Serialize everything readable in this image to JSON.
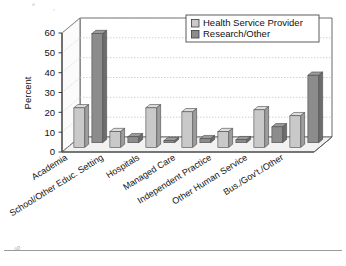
{
  "chart_data": {
    "type": "bar",
    "title": "",
    "subtitle": "",
    "xlabel": "",
    "ylabel": "Percent",
    "ylim": [
      0,
      60
    ],
    "yticks": [
      0,
      10,
      20,
      30,
      40,
      50,
      60
    ],
    "grid": true,
    "three_d": true,
    "legend_position": "top-right",
    "categories": [
      "Academia",
      "School/Other Educ. Setting",
      "Hospitals",
      "Managed Care",
      "Independent Practice",
      "Other Human Service",
      "Bus./Gov't./Other"
    ],
    "series": [
      {
        "name": "Health Service Provider",
        "color": "#c9c9c9",
        "values": [
          20,
          8,
          20,
          18,
          8,
          19,
          16
        ]
      },
      {
        "name": "Research/Other",
        "color": "#8c8c8c",
        "values": [
          55,
          3,
          1,
          2,
          1.5,
          8,
          34
        ]
      }
    ]
  },
  "legend": {
    "items": [
      {
        "label": "Health Service Provider",
        "swatch": "#c9c9c9"
      },
      {
        "label": "Research/Other",
        "swatch": "#8c8c8c"
      }
    ]
  },
  "axes": {
    "y_title": "Percent",
    "y_tick_labels": [
      "0",
      "10",
      "20",
      "30",
      "40",
      "50",
      "60"
    ]
  },
  "artifacts": {
    "stray_mark": "so"
  },
  "colors": {
    "series_light": "#c9c9c9",
    "series_dark": "#8c8c8c",
    "frame": "#4a4a4a",
    "grid": "#c0c0c0",
    "floor": "#efefef",
    "wall": "#ffffff",
    "rule": "#9a9a9a"
  }
}
